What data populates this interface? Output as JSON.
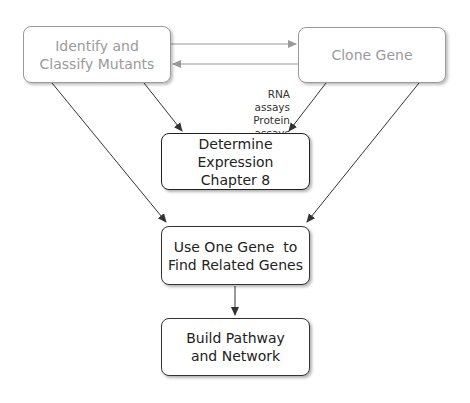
{
  "nodes": {
    "identify": {
      "lines": [
        "Identify and",
        "Classify Mutants"
      ]
    },
    "clone": {
      "lines": [
        "Clone Gene"
      ]
    },
    "determine": {
      "lines": [
        "Determine",
        "Expression",
        "Chapter 8"
      ]
    },
    "use_one_gene": {
      "lines": [
        "Use One Gene  to",
        "Find Related Genes"
      ]
    },
    "build": {
      "lines": [
        "Build Pathway",
        "and Network"
      ]
    }
  },
  "annotation": {
    "lines": [
      "RNA assays",
      "Protein assays",
      "Microarrays"
    ]
  },
  "edges": [
    {
      "from": "identify",
      "to": "clone"
    },
    {
      "from": "clone",
      "to": "identify"
    },
    {
      "from": "identify",
      "to": "determine"
    },
    {
      "from": "clone",
      "to": "determine"
    },
    {
      "from": "identify",
      "to": "use_one_gene"
    },
    {
      "from": "clone",
      "to": "use_one_gene"
    },
    {
      "from": "use_one_gene",
      "to": "build"
    }
  ],
  "colors": {
    "faded": "#9a9a9a",
    "dark": "#333333"
  }
}
